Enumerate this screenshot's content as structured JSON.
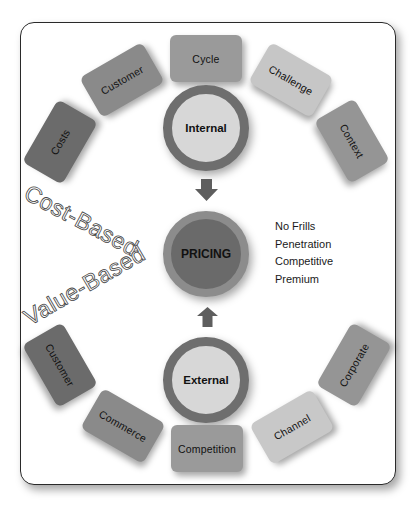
{
  "diagram": {
    "top_group": {
      "center_label": "Internal",
      "factors": [
        {
          "label": "Costs",
          "color": "#6b6b6b"
        },
        {
          "label": "Customer",
          "color": "#8a8a8a"
        },
        {
          "label": "Cycle",
          "color": "#9a9a9a"
        },
        {
          "label": "Challenge",
          "color": "#c6c6c6"
        },
        {
          "label": "Context",
          "color": "#959595"
        }
      ]
    },
    "center": {
      "label": "PRICING",
      "strategies": [
        "No Frills",
        "Penetration",
        "Competitive",
        "Premium"
      ]
    },
    "bottom_group": {
      "center_label": "External",
      "factors": [
        {
          "label": "Customer",
          "color": "#6b6b6b"
        },
        {
          "label": "Commerce",
          "color": "#8a8a8a"
        },
        {
          "label": "Competition",
          "color": "#9a9a9a"
        },
        {
          "label": "Channel",
          "color": "#c8c8c8"
        },
        {
          "label": "Corporate",
          "color": "#959595"
        }
      ]
    },
    "side_labels": {
      "cost_based": "Cost-Based",
      "value_based": "Value-Based"
    },
    "colors": {
      "frame_border": "#2a2a2a",
      "ring_dark": "#6e6e6e",
      "circle_light": "#d7d7d7",
      "pricing_ring": "#8c8c8c",
      "pricing_fill": "#6a6a6a",
      "arrow": "#5e5e5e"
    }
  }
}
